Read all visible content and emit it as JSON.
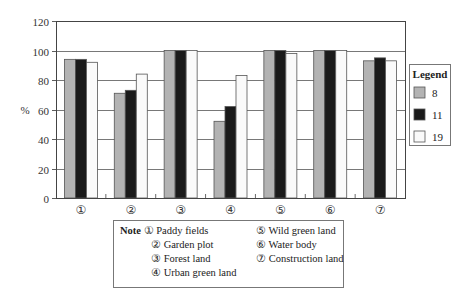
{
  "chart_data": {
    "type": "bar",
    "title": "",
    "xlabel": "",
    "ylabel": "%",
    "ylim": [
      0,
      120
    ],
    "yticks": [
      0,
      20,
      40,
      60,
      80,
      100,
      120
    ],
    "grid": true,
    "legend_position": "right",
    "legend_title": "Legend",
    "categories": [
      "①",
      "②",
      "③",
      "④",
      "⑤",
      "⑥",
      "⑦"
    ],
    "series": [
      {
        "name": "8",
        "color": "#b3b3b3",
        "values": [
          94,
          71,
          100,
          52,
          100,
          100,
          93
        ]
      },
      {
        "name": "11",
        "color": "#1a1a1a",
        "values": [
          94,
          73,
          100,
          62,
          100,
          100,
          95
        ]
      },
      {
        "name": "19",
        "color": "#fafafa",
        "values": [
          92,
          84,
          100,
          83,
          98,
          100,
          93
        ]
      }
    ]
  },
  "note": {
    "heading": "Note",
    "items": [
      {
        "marker": "①",
        "label": "Paddy fields"
      },
      {
        "marker": "②",
        "label": "Garden plot"
      },
      {
        "marker": "③",
        "label": "Forest land"
      },
      {
        "marker": "④",
        "label": "Urban green land"
      },
      {
        "marker": "⑤",
        "label": "Wild green land"
      },
      {
        "marker": "⑥",
        "label": "Water body"
      },
      {
        "marker": "⑦",
        "label": "Construction land"
      }
    ]
  }
}
